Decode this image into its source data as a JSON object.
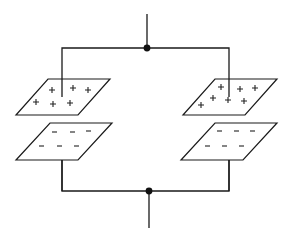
{
  "diagram": {
    "type": "parallel-capacitors",
    "colors": {
      "line": "#1a1a1a",
      "background": "#ffffff"
    },
    "nodes": [
      {
        "id": "top-junction",
        "x": 147,
        "y": 48
      },
      {
        "id": "bottom-junction",
        "x": 149,
        "y": 191
      }
    ],
    "capacitors": [
      {
        "id": "left",
        "top_plate": {
          "charge": "positive",
          "symbol": "+",
          "count": 6
        },
        "bottom_plate": {
          "charge": "negative",
          "symbol": "−",
          "count": 6
        }
      },
      {
        "id": "right",
        "top_plate": {
          "charge": "positive",
          "symbol": "+",
          "count": 7
        },
        "bottom_plate": {
          "charge": "negative",
          "symbol": "−",
          "count": 6
        }
      }
    ]
  }
}
